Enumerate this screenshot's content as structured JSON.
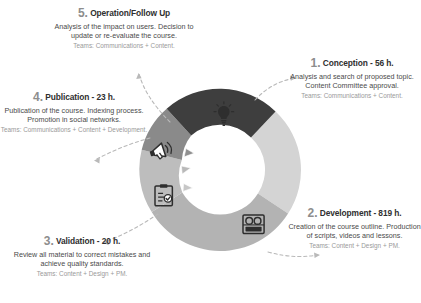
{
  "diagram": {
    "type": "cyclical-process-donut",
    "title": "",
    "segment_colors": {
      "conception": "#d4d4d4",
      "development": "#b3b3b3",
      "validation": "#bdbdbd",
      "publication": "#8a8a8a",
      "operation": "#3e3e3e"
    },
    "steps": [
      {
        "number": "1.",
        "name": "Conception",
        "hours": "- 56 h.",
        "title": "1. Conception - 56 h.",
        "description": "Analysis and search of proposed topic. Content Committee approval.",
        "teams": "Teams: Communications + Content.",
        "icon": "lightbulb-icon",
        "color": "#d4d4d4",
        "start_angle": -47,
        "end_angle": 33
      },
      {
        "number": "2.",
        "name": "Development",
        "hours": "- 819 h.",
        "title": "2. Development - 819 h.",
        "description": "Creation of the course outline. Production of scripts, videos and lessons.",
        "teams": "Teams: Content + Design + PM.",
        "icon": "video-camera-icon",
        "color": "#b3b3b3",
        "start_angle": 33,
        "end_angle": 150
      },
      {
        "number": "3.",
        "name": "Validation",
        "hours": "- 20 h.",
        "title": "3. Validation - 20 h.",
        "description": "Review all material to correct mistakes and achieve quality standards.",
        "teams": "Teams: Content + Design + PM.",
        "icon": "clipboard-check-icon",
        "color": "#bdbdbd",
        "start_angle": 150,
        "end_angle": 207
      },
      {
        "number": "4.",
        "name": "Publication",
        "hours": "- 23 h.",
        "title": "4. Publication - 23 h.",
        "description": "Publication of the course. Indexing process. Promotion in social networks.",
        "teams": "Teams: Communications + Content + Development.",
        "icon": "megaphone-icon",
        "color": "#8a8a8a",
        "start_angle": 207,
        "end_angle": 245
      },
      {
        "number": "5.",
        "name": "Operation/Follow Up",
        "hours": "",
        "title": "5. Operation/Follow Up",
        "description": "Analysis of the impact on users. Decision to update or re-evaluate the course.",
        "teams": "Teams: Communications + Content.",
        "icon": "none",
        "color": "#3e3e3e",
        "start_angle": 245,
        "end_angle": 277
      }
    ]
  }
}
